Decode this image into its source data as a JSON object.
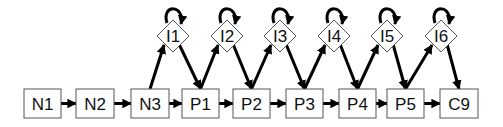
{
  "diagram": {
    "type": "flow-diagram",
    "boxes": [
      {
        "id": "N1",
        "label": "N1",
        "x": 24,
        "y": 89,
        "w": 37,
        "h": 29
      },
      {
        "id": "N2",
        "label": "N2",
        "x": 76,
        "y": 89,
        "w": 38,
        "h": 29
      },
      {
        "id": "N3",
        "label": "N3",
        "x": 131,
        "y": 89,
        "w": 38,
        "h": 29
      },
      {
        "id": "P1",
        "label": "P1",
        "x": 182,
        "y": 89,
        "w": 37,
        "h": 29
      },
      {
        "id": "P2",
        "label": "P2",
        "x": 233,
        "y": 89,
        "w": 37,
        "h": 29
      },
      {
        "id": "P3",
        "label": "P3",
        "x": 286,
        "y": 89,
        "w": 37,
        "h": 29
      },
      {
        "id": "P4",
        "label": "P4",
        "x": 339,
        "y": 89,
        "w": 37,
        "h": 29
      },
      {
        "id": "P5",
        "label": "P5",
        "x": 387,
        "y": 89,
        "w": 37,
        "h": 29
      },
      {
        "id": "C9",
        "label": "C9",
        "x": 440,
        "y": 89,
        "w": 38,
        "h": 29
      }
    ],
    "diamonds": [
      {
        "id": "I1",
        "label": "I1",
        "cx": 173,
        "cy": 36
      },
      {
        "id": "I2",
        "label": "I2",
        "cx": 227,
        "cy": 36
      },
      {
        "id": "I3",
        "label": "I3",
        "cx": 280,
        "cy": 36
      },
      {
        "id": "I4",
        "label": "I4",
        "cx": 334,
        "cy": 36
      },
      {
        "id": "I5",
        "label": "I5",
        "cx": 387,
        "cy": 36
      },
      {
        "id": "I6",
        "label": "I6",
        "cx": 441,
        "cy": 36
      }
    ],
    "edges": [
      [
        "N1",
        "N2"
      ],
      [
        "N2",
        "N3"
      ],
      [
        "N3",
        "P1"
      ],
      [
        "P1",
        "P2"
      ],
      [
        "P2",
        "P3"
      ],
      [
        "P3",
        "P4"
      ],
      [
        "P4",
        "P5"
      ],
      [
        "P5",
        "C9"
      ],
      [
        "N3",
        "I1"
      ],
      [
        "I1",
        "P1"
      ],
      [
        "P1",
        "I2"
      ],
      [
        "I2",
        "P2"
      ],
      [
        "P2",
        "I3"
      ],
      [
        "I3",
        "P3"
      ],
      [
        "P3",
        "I4"
      ],
      [
        "I4",
        "P4"
      ],
      [
        "P4",
        "I5"
      ],
      [
        "I5",
        "P5"
      ],
      [
        "P5",
        "I6"
      ],
      [
        "I6",
        "C9"
      ],
      [
        "I1",
        "I1"
      ],
      [
        "I2",
        "I2"
      ],
      [
        "I3",
        "I3"
      ],
      [
        "I4",
        "I4"
      ],
      [
        "I5",
        "I5"
      ],
      [
        "I6",
        "I6"
      ]
    ]
  }
}
